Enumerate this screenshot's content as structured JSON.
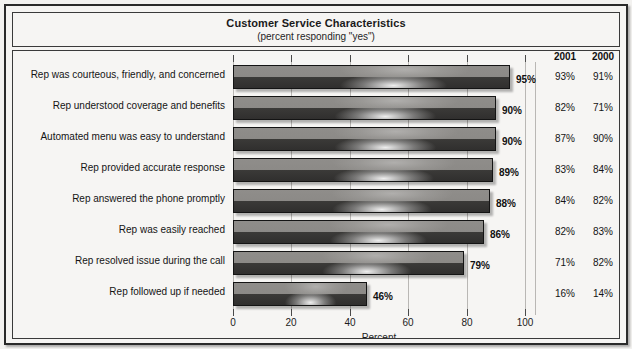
{
  "chart": {
    "title": "Customer Service Characteristics",
    "subtitle": "(percent responding \"yes\")",
    "axis_title": "Percent",
    "column_headers": [
      "2001",
      "2000"
    ]
  },
  "chart_data": {
    "type": "bar",
    "orientation": "horizontal",
    "title": "Customer Service Characteristics",
    "subtitle": "(percent responding \"yes\")",
    "xlabel": "Percent",
    "ylabel": "",
    "xlim": [
      0,
      100
    ],
    "xticks": [
      0,
      20,
      40,
      60,
      80,
      100
    ],
    "xticklabels": [
      "0",
      "20",
      "40",
      "60",
      "80",
      "100"
    ],
    "grid": true,
    "legend": false,
    "categories": [
      "Rep was courteous, friendly, and concerned",
      "Rep understood coverage and benefits",
      "Automated menu was easy to understand",
      "Rep provided accurate response",
      "Rep answered the phone promptly",
      "Rep was easily reached",
      "Rep resolved issue during the call",
      "Rep followed up if needed"
    ],
    "values": [
      95,
      90,
      90,
      89,
      88,
      86,
      79,
      46
    ],
    "value_labels": [
      "95%",
      "90%",
      "90%",
      "89%",
      "88%",
      "86%",
      "79%",
      "46%"
    ],
    "series": [
      {
        "name": "2002",
        "values": [
          95,
          90,
          90,
          89,
          88,
          86,
          79,
          46
        ],
        "labels": [
          "95%",
          "90%",
          "90%",
          "89%",
          "88%",
          "86%",
          "79%",
          "46%"
        ]
      },
      {
        "name": "2001",
        "values": [
          93,
          82,
          87,
          83,
          84,
          82,
          71,
          16
        ],
        "labels": [
          "93%",
          "82%",
          "87%",
          "83%",
          "84%",
          "82%",
          "71%",
          "16%"
        ]
      },
      {
        "name": "2000",
        "values": [
          91,
          71,
          90,
          84,
          82,
          83,
          82,
          14
        ],
        "labels": [
          "91%",
          "71%",
          "90%",
          "84%",
          "82%",
          "83%",
          "82%",
          "14%"
        ]
      }
    ],
    "table_columns": [
      "2001",
      "2000"
    ],
    "table_rows": [
      [
        "93%",
        "91%"
      ],
      [
        "82%",
        "71%"
      ],
      [
        "87%",
        "90%"
      ],
      [
        "83%",
        "84%"
      ],
      [
        "84%",
        "82%"
      ],
      [
        "82%",
        "83%"
      ],
      [
        "71%",
        "82%"
      ],
      [
        "16%",
        "14%"
      ]
    ],
    "colors": {
      "bar_top": "#8f8d8a",
      "bar_bottom": "#302f2e",
      "bar_border": "#141414",
      "background": "#f6f5f3",
      "gridline": "#b9b7b4",
      "text": "#141414"
    }
  }
}
